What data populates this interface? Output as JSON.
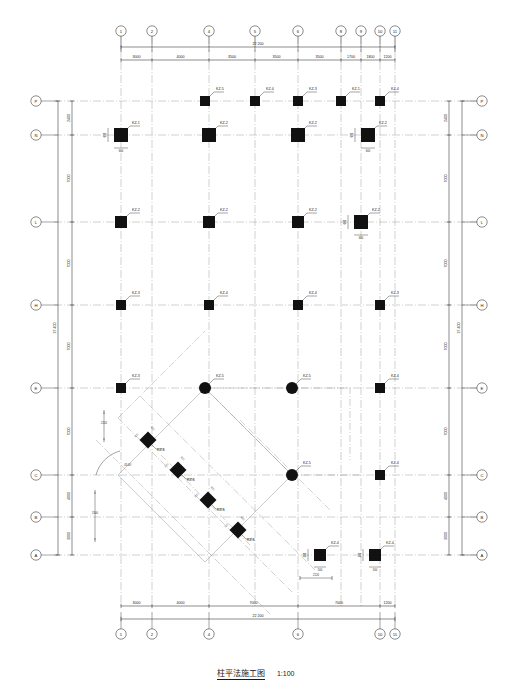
{
  "drawing": {
    "title": "柱平法施工图",
    "scale": "1:100",
    "sheet_width": 511,
    "sheet_height": 690,
    "line_color": "#1a1a1a",
    "grid_color": "#8a8a8a",
    "column_fill": "#111111"
  },
  "grids": {
    "horizontal_labels": [
      "1",
      "2",
      "4",
      "5",
      "6",
      "8",
      "9",
      "10",
      "11"
    ],
    "vertical_labels": [
      "P",
      "N",
      "L",
      "H",
      "E",
      "C",
      "B",
      "A"
    ],
    "bottom_labels": [
      "1",
      "2",
      "4",
      "6",
      "10",
      "11"
    ]
  },
  "dimensions": {
    "top_chain": [
      "3000",
      "4000",
      "3500",
      "3500",
      "3500",
      "1700",
      "1800",
      "1200"
    ],
    "top_total": "22 200",
    "bottom_chain": [
      "3000",
      "4000",
      "7000",
      "7000",
      "1200"
    ],
    "bottom_total": "22 200",
    "left_chain": [
      "2400",
      "7000",
      "7000",
      "7000",
      "7000",
      "4000",
      "3000"
    ],
    "left_total": "37 400",
    "right_chain": [
      "2400",
      "7000",
      "7000",
      "7000",
      "7000",
      "4000",
      "3000"
    ],
    "right_total": "37 400",
    "local": [
      "2120",
      "2120",
      "2120",
      "1500",
      "1500",
      "2300",
      "2300",
      "45.00°"
    ]
  },
  "columns": [
    {
      "id": "c1",
      "label": "KZ-5",
      "x": 205,
      "y": 101,
      "shape": "square",
      "size": 5
    },
    {
      "id": "c2",
      "label": "KZ-4",
      "x": 255,
      "y": 101,
      "shape": "square",
      "size": 5
    },
    {
      "id": "c3",
      "label": "KZ-3",
      "x": 298,
      "y": 101,
      "shape": "square",
      "size": 5
    },
    {
      "id": "c4",
      "label": "KZ-1",
      "x": 341,
      "y": 101,
      "shape": "square",
      "size": 5
    },
    {
      "id": "c5",
      "label": "KZ-4",
      "x": 380,
      "y": 101,
      "shape": "square",
      "size": 5
    },
    {
      "id": "c6",
      "label": "KZ-1",
      "x": 121,
      "y": 135,
      "shape": "square",
      "size": 7,
      "spec": "600×600",
      "dimtext": "600"
    },
    {
      "id": "c7",
      "label": "KZ-2",
      "x": 209,
      "y": 135,
      "shape": "square",
      "size": 7
    },
    {
      "id": "c8",
      "label": "KZ-2",
      "x": 298,
      "y": 135,
      "shape": "square",
      "size": 7
    },
    {
      "id": "c9",
      "label": "KZ-2",
      "x": 368,
      "y": 135,
      "shape": "square",
      "size": 7,
      "spec": "600×600",
      "dimtext": "600"
    },
    {
      "id": "c10",
      "label": "KZ-2",
      "x": 121,
      "y": 222,
      "shape": "square",
      "size": 6
    },
    {
      "id": "c11",
      "label": "KZ-2",
      "x": 209,
      "y": 222,
      "shape": "square",
      "size": 6
    },
    {
      "id": "c12",
      "label": "KZ-2",
      "x": 298,
      "y": 222,
      "shape": "square",
      "size": 6
    },
    {
      "id": "c13",
      "label": "KZ-2",
      "x": 361,
      "y": 222,
      "shape": "square",
      "size": 7,
      "spec": "600×600",
      "dimtext": "600"
    },
    {
      "id": "c14",
      "label": "KZ-3",
      "x": 121,
      "y": 305,
      "shape": "square",
      "size": 5
    },
    {
      "id": "c15",
      "label": "KZ-4",
      "x": 209,
      "y": 305,
      "shape": "square",
      "size": 5
    },
    {
      "id": "c16",
      "label": "KZ-4",
      "x": 298,
      "y": 305,
      "shape": "square",
      "size": 5
    },
    {
      "id": "c17",
      "label": "KZ-3",
      "x": 380,
      "y": 305,
      "shape": "square",
      "size": 5
    },
    {
      "id": "c18",
      "label": "KZ-3",
      "x": 121,
      "y": 388,
      "shape": "square",
      "size": 5
    },
    {
      "id": "c19",
      "label": "KZ-5",
      "x": 205,
      "y": 388,
      "shape": "circle",
      "size": 6
    },
    {
      "id": "c20",
      "label": "KZ-5",
      "x": 292,
      "y": 388,
      "shape": "circle",
      "size": 6
    },
    {
      "id": "c21",
      "label": "KZ-4",
      "x": 380,
      "y": 388,
      "shape": "square",
      "size": 5
    },
    {
      "id": "c22",
      "label": "KZ-5",
      "x": 292,
      "y": 475,
      "shape": "circle",
      "size": 6
    },
    {
      "id": "c23",
      "label": "KZ-4",
      "x": 380,
      "y": 475,
      "shape": "square",
      "size": 5
    },
    {
      "id": "c24",
      "label": "KZ-4",
      "x": 320,
      "y": 555,
      "shape": "square",
      "size": 6,
      "spec": "500×500",
      "dimtext": "500"
    },
    {
      "id": "c25",
      "label": "KZ-4",
      "x": 375,
      "y": 555,
      "shape": "square",
      "size": 6,
      "spec": "500×500",
      "dimtext": "500"
    }
  ],
  "rotated_columns": [
    {
      "id": "d1",
      "label": "KZ-6",
      "x": 148,
      "y": 440,
      "size": 6,
      "spec": "500×500"
    },
    {
      "id": "d2",
      "label": "KZ-6",
      "x": 178,
      "y": 470,
      "size": 6,
      "spec": "500×500"
    },
    {
      "id": "d3",
      "label": "KZ-6",
      "x": 208,
      "y": 500,
      "size": 6,
      "spec": "500×500"
    },
    {
      "id": "d4",
      "label": "KZ-6",
      "x": 238,
      "y": 530,
      "size": 6,
      "spec": "500×500"
    }
  ],
  "legend_note": {
    "angle_label": "45.00°"
  }
}
